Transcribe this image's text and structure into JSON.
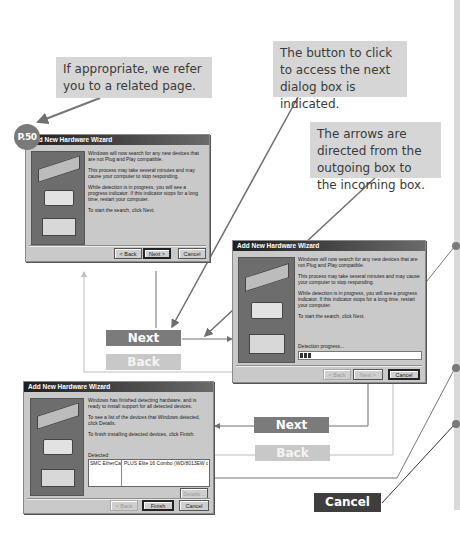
{
  "callouts": {
    "related_page": "If appropriate, we refer you to a related page.",
    "button_indicated": "The button to click to access the next dialog box is indicated.",
    "arrows_direction": "The arrows are directed from the outgoing box to the incoming box."
  },
  "page_reference": "P.50",
  "dialog1": {
    "title": "Add New Hardware Wizard",
    "paragraphs": [
      "Windows will now search for any new devices that are not Plug and Play compatible.",
      "This process may take several minutes and may cause your computer to stop responding.",
      "While detection is in progress, you will see a progress indicator. If this indicator stops for a long time, restart your computer.",
      "To start the search, click Next."
    ],
    "buttons": {
      "back": "< Back",
      "next": "Next >",
      "cancel": "Cancel"
    }
  },
  "dialog2": {
    "title": "Add New Hardware Wizard",
    "paragraphs": [
      "Windows will now search for any new devices that are not Plug and Play compatible.",
      "This process may take several minutes and may cause your computer to stop responding.",
      "While detection is in progress, you will see a progress indicator. If this indicator stops for a long time, restart your computer.",
      "To start the search, click Next."
    ],
    "progress_label": "Detection progress...",
    "progress_segments": 3,
    "buttons": {
      "back": "< Back",
      "next": "Next >",
      "cancel": "Cancel"
    }
  },
  "dialog3": {
    "title": "Add New Hardware Wizard",
    "paragraphs": [
      "Windows has finished detecting hardware, and is ready to install support for all detected devices.",
      "To see a list of the devices that Windows detected, click Details.",
      "To finish installing detected devices, click Finish."
    ],
    "detected_label": "Detected:",
    "detected_items": [
      "SMC EtherCard",
      "PLUS Elite 16 Combo (WD/8013EW or ..."
    ],
    "buttons": {
      "details": "Details...",
      "back": "< Back",
      "finish": "Finish",
      "cancel": "Cancel"
    }
  },
  "labels": {
    "next_1": "Next",
    "back_1": "Back",
    "next_2": "Next",
    "back_2": "Back",
    "cancel": "Cancel"
  },
  "colors": {
    "next_label": "#7b7b7b",
    "back_label": "#c8c8c8",
    "cancel_label": "#3e3e3e",
    "callout_bg": "#d6d6d6"
  }
}
